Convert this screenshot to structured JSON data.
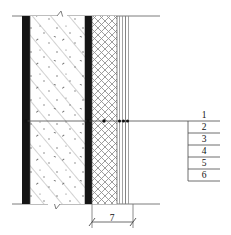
{
  "drawing": {
    "title": "Wall section detail",
    "type": "architectural-wall-section",
    "colors": {
      "line": "#6e6e6e",
      "dark_line": "#111111",
      "solid_layer": "#151515",
      "hatch": "#8c8c8c",
      "background": "#ffffff"
    }
  },
  "legend": {
    "items": [
      {
        "number": "1"
      },
      {
        "number": "2"
      },
      {
        "number": "3"
      },
      {
        "number": "4"
      },
      {
        "number": "5"
      },
      {
        "number": "6"
      }
    ]
  },
  "dimension": {
    "label": "7"
  },
  "layers": [
    {
      "id": "outer-finish-bar",
      "style": "solid-black",
      "x": 22,
      "width": 8
    },
    {
      "id": "reinforced-concrete",
      "style": "diagonal-hatch-dots",
      "x": 30,
      "width": 55
    },
    {
      "id": "inner-finish-bar",
      "style": "solid-black",
      "x": 85,
      "width": 7
    },
    {
      "id": "insulation",
      "style": "cross-hatch",
      "x": 92,
      "width": 25
    },
    {
      "id": "render-line-1",
      "style": "thin-line",
      "x": 119,
      "width": 1
    },
    {
      "id": "render-line-2",
      "style": "thin-line",
      "x": 122,
      "width": 1
    },
    {
      "id": "render-line-3",
      "style": "thin-line",
      "x": 125,
      "width": 1
    },
    {
      "id": "render-line-4",
      "style": "thin-line",
      "x": 128,
      "width": 1
    }
  ]
}
